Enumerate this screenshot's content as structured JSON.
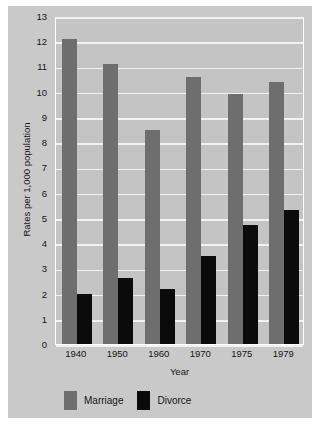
{
  "chart_data": {
    "type": "bar",
    "title": "",
    "xlabel": "Year",
    "ylabel": "Rates per 1,000 population",
    "categories": [
      "1940",
      "1950",
      "1960",
      "1970",
      "1975",
      "1979"
    ],
    "series": [
      {
        "name": "Marriage",
        "color": "#6e6e6e",
        "values": [
          12.1,
          11.1,
          8.5,
          10.6,
          9.9,
          10.4
        ]
      },
      {
        "name": "Divorce",
        "color": "#0b0b0b",
        "values": [
          2.0,
          2.6,
          2.2,
          3.5,
          4.7,
          5.3
        ]
      }
    ],
    "ylim": [
      0,
      13
    ],
    "yticks": [
      0,
      1,
      2,
      3,
      4,
      5,
      6,
      7,
      8,
      9,
      10,
      11,
      12,
      13
    ],
    "ytick_labels": [
      "0",
      "1",
      "2",
      "3",
      "4",
      "5",
      "6",
      "7",
      "8",
      "9",
      "10",
      "11",
      "12",
      "13"
    ],
    "grid": true,
    "grid_color": "#f2f2f2",
    "legend_position": "bottom-left",
    "plot_background": "#c4c4c4",
    "figure_background": "#c9c9c9"
  }
}
